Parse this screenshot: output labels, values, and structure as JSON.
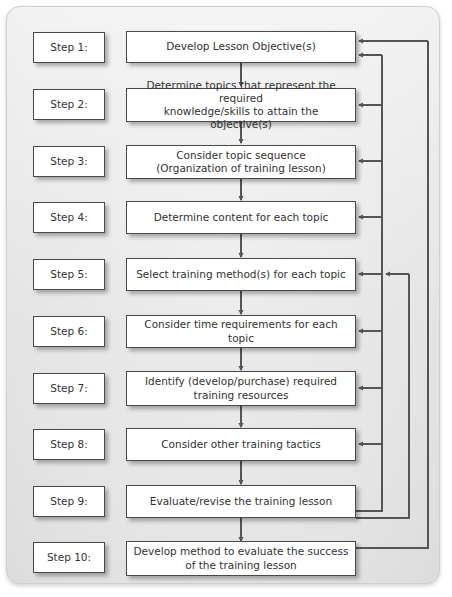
{
  "diagram": {
    "background_color": "#e9e9e9",
    "node_fill": "#ffffff",
    "node_border": "#4a4a4a",
    "connector_color": "#555555",
    "steps": [
      {
        "label": "Step 1:",
        "lines": [
          "Develop Lesson Objective(s)"
        ],
        "text": "Develop Lesson Objective(s)"
      },
      {
        "label": "Step 2:",
        "lines": [
          "Determine topics that represent the required",
          "knowledge/skills to attain the objective(s)"
        ],
        "text": "Determine topics that represent the required knowledge/skills to attain the objective(s)"
      },
      {
        "label": "Step 3:",
        "lines": [
          "Consider topic sequence",
          "(Organization of training lesson)"
        ],
        "text": "Consider topic sequence (Organization of training lesson)"
      },
      {
        "label": "Step 4:",
        "lines": [
          "Determine content for each topic"
        ],
        "text": "Determine content for each topic"
      },
      {
        "label": "Step 5:",
        "lines": [
          "Select training method(s) for each topic"
        ],
        "text": "Select training method(s) for each topic"
      },
      {
        "label": "Step 6:",
        "lines": [
          "Consider time requirements for each topic"
        ],
        "text": "Consider time requirements for each topic"
      },
      {
        "label": "Step 7:",
        "lines": [
          "Identify (develop/purchase) required",
          "training resources"
        ],
        "text": "Identify (develop/purchase) required training resources"
      },
      {
        "label": "Step 8:",
        "lines": [
          "Consider other training tactics"
        ],
        "text": "Consider other training tactics"
      },
      {
        "label": "Step 9:",
        "lines": [
          "Evaluate/revise the training lesson"
        ],
        "text": "Evaluate/revise the training lesson"
      },
      {
        "label": "Step 10:",
        "lines": [
          "Develop method to evaluate the success",
          "of the training lesson"
        ],
        "text": "Develop method to evaluate the success of the training lesson"
      }
    ],
    "flow_arrows": [
      {
        "from": "Step 1",
        "to": "Step 2"
      },
      {
        "from": "Step 2",
        "to": "Step 3"
      },
      {
        "from": "Step 3",
        "to": "Step 4"
      },
      {
        "from": "Step 4",
        "to": "Step 5"
      },
      {
        "from": "Step 5",
        "to": "Step 6"
      },
      {
        "from": "Step 6",
        "to": "Step 7"
      },
      {
        "from": "Step 7",
        "to": "Step 8"
      },
      {
        "from": "Step 8",
        "to": "Step 9"
      },
      {
        "from": "Step 9",
        "to": "Step 10"
      }
    ],
    "feedback_arrows": [
      {
        "from": "Step 9",
        "to": "Step 1"
      },
      {
        "from": "Step 9",
        "to": "Step 2"
      },
      {
        "from": "Step 9",
        "to": "Step 3"
      },
      {
        "from": "Step 9",
        "to": "Step 4"
      },
      {
        "from": "Step 9",
        "to": "Step 5"
      },
      {
        "from": "Step 9",
        "to": "Step 6"
      },
      {
        "from": "Step 9",
        "to": "Step 7"
      },
      {
        "from": "Step 9",
        "to": "Step 8"
      },
      {
        "from": "Step 10",
        "to": "Step 1"
      },
      {
        "from": "Step 10",
        "to": "Step 5"
      }
    ]
  }
}
